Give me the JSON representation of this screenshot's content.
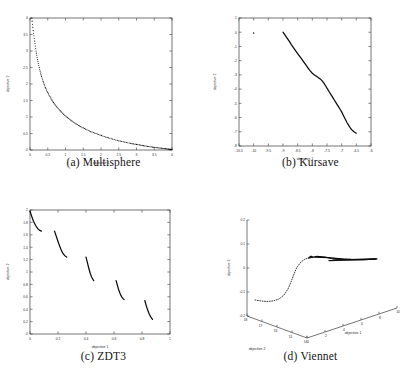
{
  "figure": {
    "panels": [
      {
        "tag": "(a)",
        "caption": "(a) Multisphere",
        "xlabel": "objective 1",
        "ylabel": "objective 2",
        "xticks": [
          "0",
          "0.5",
          "1",
          "1.5",
          "2",
          "2.5",
          "3",
          "3.5",
          "4"
        ],
        "yticks": [
          "0",
          "0.5",
          "1",
          "1.5",
          "2",
          "2.5",
          "3",
          "3.5",
          "4"
        ]
      },
      {
        "tag": "(b)",
        "caption": "(b) Kursave",
        "xlabel": "objective 1",
        "ylabel": "objective 2",
        "xticks": [
          "-10.5",
          "-10",
          "-9.5",
          "-9",
          "-8.5",
          "-8",
          "-7.5",
          "-7",
          "-6.5",
          "-6"
        ],
        "yticks": [
          "-8",
          "-7",
          "-6",
          "-5",
          "-4",
          "-3",
          "-2",
          "-1",
          "0",
          "1"
        ]
      },
      {
        "tag": "(c)",
        "caption": "(c) ZDT3",
        "xlabel": "objective 1",
        "ylabel": "objective 2",
        "xticks": [
          "0",
          "0.2",
          "0.4",
          "0.6",
          "0.8",
          "1"
        ],
        "yticks": [
          "0",
          "0.2",
          "0.4",
          "0.6",
          "0.8",
          "1",
          "1.2",
          "1.4",
          "1.6",
          "1.8",
          "2"
        ]
      },
      {
        "tag": "(d)",
        "caption": "(d) Viennet",
        "xlabel": "objective 1",
        "ylabel": "objective 2",
        "zlabel": "objective 3",
        "xticks": [
          "0",
          "2",
          "4",
          "6",
          "8",
          "10"
        ],
        "yticks": [
          "18",
          "17",
          "16",
          "15",
          "14"
        ],
        "zticks": [
          "-0.2",
          "-0.1",
          "0",
          "0.1",
          "0.2"
        ]
      }
    ]
  },
  "chart_data": [
    {
      "type": "scatter",
      "title": "(a) Multisphere",
      "xlabel": "objective 1",
      "ylabel": "objective 2",
      "xlim": [
        0,
        4
      ],
      "ylim": [
        0,
        4
      ],
      "xticks": [
        0,
        0.5,
        1,
        1.5,
        2,
        2.5,
        3,
        3.5,
        4
      ],
      "yticks": [
        0,
        0.5,
        1,
        1.5,
        2,
        2.5,
        3,
        3.5,
        4
      ],
      "grid": false,
      "legend": null,
      "description": "Dotted convex hyperbolic Pareto front decreasing from (0.05,4) to (4,0.02)",
      "points_x": [
        0.05,
        0.09,
        0.13,
        0.17,
        0.21,
        0.26,
        0.31,
        0.37,
        0.43,
        0.5,
        0.58,
        0.66,
        0.75,
        0.85,
        0.95,
        1.06,
        1.18,
        1.3,
        1.43,
        1.57,
        1.71,
        1.86,
        2.01,
        2.17,
        2.33,
        2.5,
        2.67,
        2.84,
        3.0,
        3.16,
        3.31,
        3.45,
        3.58,
        3.7,
        3.81,
        3.9,
        3.96,
        4.0
      ],
      "points_y": [
        4.0,
        3.62,
        3.3,
        3.0,
        2.74,
        2.5,
        2.28,
        2.08,
        1.9,
        1.74,
        1.58,
        1.44,
        1.31,
        1.19,
        1.08,
        0.98,
        0.88,
        0.79,
        0.71,
        0.63,
        0.56,
        0.5,
        0.44,
        0.38,
        0.33,
        0.28,
        0.24,
        0.2,
        0.17,
        0.14,
        0.11,
        0.09,
        0.07,
        0.055,
        0.04,
        0.03,
        0.02,
        0.015
      ]
    },
    {
      "type": "scatter",
      "title": "(b) Kursave",
      "xlabel": "objective 1",
      "ylabel": "objective 2",
      "xlim": [
        -10.5,
        -6
      ],
      "ylim": [
        -8,
        1
      ],
      "xticks": [
        -10.5,
        -10,
        -9.5,
        -9,
        -8.5,
        -8,
        -7.5,
        -7,
        -6.5,
        -6
      ],
      "yticks": [
        -8,
        -7,
        -6,
        -5,
        -4,
        -3,
        -2,
        -1,
        0,
        1
      ],
      "grid": false,
      "legend": null,
      "description": "Dense dark curve descending from (-9,0) to (-6.5,-7.1) with a knee near (-7.6,-3.2); one isolated outlier point near (-10,0)",
      "points_x": [
        -9.0,
        -8.93,
        -8.86,
        -8.79,
        -8.72,
        -8.65,
        -8.58,
        -8.5,
        -8.43,
        -8.36,
        -8.29,
        -8.22,
        -8.15,
        -8.08,
        -8.0,
        -7.93,
        -7.86,
        -7.79,
        -7.72,
        -7.65,
        -7.6,
        -7.54,
        -7.48,
        -7.42,
        -7.36,
        -7.3,
        -7.24,
        -7.18,
        -7.12,
        -7.06,
        -7.0,
        -6.94,
        -6.88,
        -6.82,
        -6.76,
        -6.7,
        -6.64,
        -6.58,
        -6.54,
        -6.5
      ],
      "points_y": [
        0.0,
        -0.2,
        -0.42,
        -0.63,
        -0.85,
        -1.06,
        -1.27,
        -1.5,
        -1.7,
        -1.9,
        -2.1,
        -2.3,
        -2.5,
        -2.7,
        -2.88,
        -3.0,
        -3.1,
        -3.2,
        -3.3,
        -3.45,
        -3.6,
        -3.8,
        -4.0,
        -4.2,
        -4.4,
        -4.6,
        -4.8,
        -5.0,
        -5.2,
        -5.4,
        -5.6,
        -5.85,
        -6.1,
        -6.35,
        -6.55,
        -6.75,
        -6.9,
        -7.0,
        -7.05,
        -7.1
      ],
      "outliers_x": [
        -10.0
      ],
      "outliers_y": [
        -0.05
      ]
    },
    {
      "type": "scatter",
      "title": "(c) ZDT3",
      "xlabel": "objective 1",
      "ylabel": "objective 2",
      "xlim": [
        0,
        1
      ],
      "ylim": [
        0,
        2
      ],
      "xticks": [
        0,
        0.2,
        0.4,
        0.6,
        0.8,
        1
      ],
      "yticks": [
        0,
        0.2,
        0.4,
        0.6,
        0.8,
        1,
        1.2,
        1.4,
        1.6,
        1.8,
        2
      ],
      "grid": false,
      "legend": null,
      "description": "Five disconnected descending Pareto segments characteristic of ZDT3",
      "segments": [
        {
          "x": [
            0.0,
            0.012,
            0.025,
            0.04,
            0.055,
            0.07,
            0.082
          ],
          "y": [
            1.98,
            1.9,
            1.82,
            1.75,
            1.7,
            1.67,
            1.66
          ]
        },
        {
          "x": [
            0.175,
            0.19,
            0.205,
            0.22,
            0.235,
            0.25,
            0.262
          ],
          "y": [
            1.66,
            1.56,
            1.46,
            1.37,
            1.3,
            1.26,
            1.24
          ]
        },
        {
          "x": [
            0.4,
            0.41,
            0.42,
            0.43,
            0.44,
            0.45,
            0.455
          ],
          "y": [
            1.24,
            1.15,
            1.06,
            0.98,
            0.92,
            0.88,
            0.86
          ]
        },
        {
          "x": [
            0.615,
            0.625,
            0.635,
            0.645,
            0.655,
            0.665,
            0.672
          ],
          "y": [
            0.86,
            0.78,
            0.7,
            0.645,
            0.6,
            0.57,
            0.555
          ]
        },
        {
          "x": [
            0.82,
            0.83,
            0.84,
            0.85,
            0.86,
            0.87,
            0.875
          ],
          "y": [
            0.54,
            0.46,
            0.39,
            0.33,
            0.285,
            0.25,
            0.235
          ]
        }
      ]
    },
    {
      "type": "scatter",
      "title": "(d) Viennet",
      "xlabel": "objective 1",
      "ylabel": "objective 2",
      "zlabel": "objective 3",
      "xlim": [
        0,
        10
      ],
      "ylim": [
        14,
        18
      ],
      "zlim": [
        -0.2,
        0.2
      ],
      "xticks": [
        0,
        2,
        4,
        6,
        8,
        10
      ],
      "yticks": [
        18,
        17,
        16,
        15,
        14
      ],
      "zticks": [
        -0.2,
        -0.1,
        0,
        0.1,
        0.2
      ],
      "grid": false,
      "legend": null,
      "description": "3D axes projection: a dotted arc rising from objective3 about -0.16 up to about 0.05, joining a dense dark horizontal cluster near objective3 = 0.04"
    }
  ]
}
